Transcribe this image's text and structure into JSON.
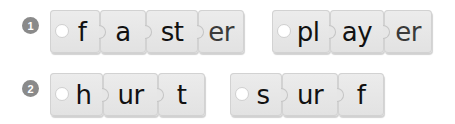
{
  "exercises": [
    {
      "number": "1",
      "words": [
        {
          "pieces": [
            "f",
            "a",
            "st",
            "er"
          ]
        },
        {
          "pieces": [
            "pl",
            "ay",
            "er"
          ]
        }
      ]
    },
    {
      "number": "2",
      "words": [
        {
          "pieces": [
            "h",
            "ur",
            "t"
          ]
        },
        {
          "pieces": [
            "s",
            "ur",
            "f"
          ]
        }
      ]
    }
  ],
  "colors": {
    "badge": "#8a8a8a",
    "piece": "#e6e6e6",
    "text": "#111111",
    "suffix_text": "#3a3a3a"
  }
}
